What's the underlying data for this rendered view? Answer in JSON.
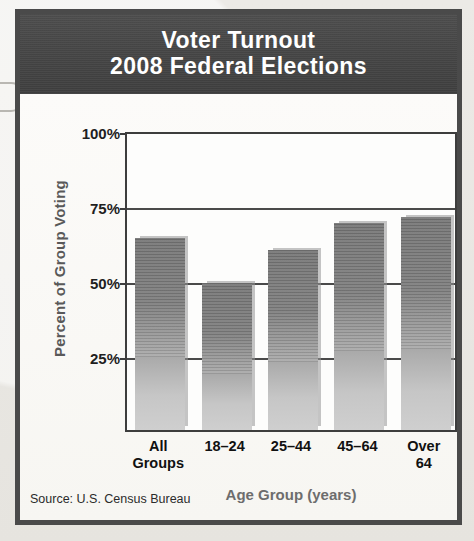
{
  "figure": {
    "title_line1": "Voter Turnout",
    "title_line2": "2008 Federal Elections",
    "source": "Source: U.S. Census Bureau",
    "banner_color": "#454545",
    "frame_color": "#4a4a4a",
    "bar_color_top": "#767676",
    "bar_color_bottom": "#cfcfcf",
    "axis_title_color": "#6d6d6d"
  },
  "ghosts": {
    "g1": "back text",
    "g2": "bleed through",
    "g3": "reversed print",
    "g4": "ghosting",
    "g5": "ink show"
  },
  "chart_data": {
    "type": "bar",
    "title": "Voter Turnout 2008 Federal Elections",
    "subtitle": "",
    "xlabel": "Age Group (years)",
    "ylabel": "Percent of Group Voting",
    "categories": [
      "All Groups",
      "18–24",
      "25–44",
      "45–64",
      "Over 64"
    ],
    "category_lines": [
      [
        "All",
        "Groups"
      ],
      [
        "18–24"
      ],
      [
        "25–44"
      ],
      [
        "45–64"
      ],
      [
        "Over",
        "64"
      ]
    ],
    "values": [
      64,
      49,
      60,
      69,
      71
    ],
    "ylim": [
      0,
      100
    ],
    "yticks": [
      25,
      75,
      50,
      100
    ],
    "ytick_labels": [
      "100%",
      "75%",
      "50%",
      "25%"
    ],
    "ytick_values": [
      100,
      75,
      50,
      25
    ],
    "grid": true,
    "legend": "none",
    "source": "Source: U.S. Census Bureau"
  }
}
